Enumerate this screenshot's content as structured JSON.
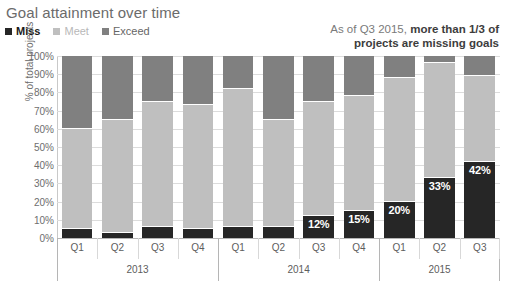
{
  "title": "Goal attainment over time",
  "legend": {
    "items": [
      {
        "label": "Miss",
        "color": "#262626"
      },
      {
        "label": "Meet",
        "color": "#bfbfbf"
      },
      {
        "label": "Exceed",
        "color": "#808080"
      }
    ]
  },
  "annotation": {
    "normal": "As of Q3 2015, ",
    "bold": "more than 1/3 of projects are missing goals"
  },
  "axes": {
    "ylabel": "% of total projects",
    "yticks": [
      "0%",
      "10%",
      "20%",
      "30%",
      "40%",
      "50%",
      "60%",
      "70%",
      "80%",
      "90%",
      "100%"
    ],
    "ytick_values": [
      0,
      10,
      20,
      30,
      40,
      50,
      60,
      70,
      80,
      90,
      100
    ],
    "quarters": [
      "Q1",
      "Q2",
      "Q3",
      "Q4",
      "Q1",
      "Q2",
      "Q3",
      "Q4",
      "Q1",
      "Q2",
      "Q3"
    ],
    "years": [
      {
        "label": "2013",
        "count": 4
      },
      {
        "label": "2014",
        "count": 4
      },
      {
        "label": "2015",
        "count": 3
      }
    ]
  },
  "chart_data": {
    "type": "bar",
    "stacked": true,
    "title": "Goal attainment over time",
    "xlabel": "",
    "ylabel": "% of total projects",
    "ylim": [
      0,
      100
    ],
    "grid": true,
    "legend_position": "top-left",
    "categories": [
      "Q1 2013",
      "Q2 2013",
      "Q3 2013",
      "Q4 2013",
      "Q1 2014",
      "Q2 2014",
      "Q3 2014",
      "Q4 2014",
      "Q1 2015",
      "Q2 2015",
      "Q3 2015"
    ],
    "series": [
      {
        "name": "Miss",
        "color": "#262626",
        "values": [
          5,
          3,
          6,
          5,
          6,
          6,
          12,
          15,
          20,
          33,
          42
        ],
        "data_labels": [
          null,
          null,
          null,
          null,
          null,
          null,
          "12%",
          "15%",
          "20%",
          "33%",
          "42%"
        ]
      },
      {
        "name": "Meet",
        "color": "#bfbfbf",
        "values": [
          55,
          62,
          69,
          68,
          76,
          59,
          63,
          63,
          68,
          63,
          47
        ],
        "data_labels": [
          null,
          null,
          null,
          null,
          null,
          null,
          null,
          null,
          null,
          null,
          null
        ]
      },
      {
        "name": "Exceed",
        "color": "#808080",
        "values": [
          40,
          35,
          25,
          27,
          18,
          35,
          25,
          22,
          12,
          4,
          11
        ],
        "data_labels": [
          null,
          null,
          null,
          null,
          null,
          null,
          null,
          null,
          null,
          null,
          null
        ]
      }
    ],
    "annotations": [
      {
        "text": "As of Q3 2015, more than 1/3 of projects are missing goals",
        "position": "top-right"
      }
    ]
  }
}
